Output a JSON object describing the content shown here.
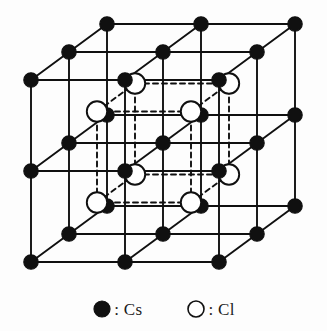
{
  "figure": {
    "type": "crystal-lattice-diagram",
    "projection": "oblique",
    "background_color": "#fdfdfd",
    "line_color": "#101010",
    "width": 327,
    "height": 331
  },
  "legend": {
    "items": [
      {
        "icon": "filled-circle",
        "separator": ":",
        "label": "Cs",
        "text": ": Cs",
        "fill": "#101010",
        "stroke": "#101010",
        "radius": 8
      },
      {
        "icon": "open-circle",
        "separator": ":",
        "label": "Cl",
        "text": ": Cl",
        "fill": "#ffffff",
        "stroke": "#101010",
        "radius": 8
      }
    ]
  },
  "lattice": {
    "origin": {
      "x": 31,
      "y": 262
    },
    "step_x": 94,
    "step_y": -91,
    "depth_dx": 38,
    "depth_dy": -28,
    "cs": {
      "element": "Cs",
      "counts": {
        "nx": 3,
        "ny": 3,
        "nz": 3
      },
      "total": 27,
      "radius": 7.2,
      "fill": "#101010",
      "stroke": "#101010",
      "stroke_width": 1.2
    },
    "cl": {
      "element": "Cl",
      "counts": {
        "nx": 2,
        "ny": 2,
        "nz": 2
      },
      "total": 8,
      "radius": 10.2,
      "fill": "#ffffff",
      "stroke": "#101010",
      "stroke_width": 1.9,
      "offset_fraction": 0.5
    },
    "bonds": {
      "solid_stroke": "#101010",
      "solid_width": 1.9,
      "dashed_stroke": "#101010",
      "dashed_width": 1.9,
      "dash_pattern": "5,4"
    }
  }
}
